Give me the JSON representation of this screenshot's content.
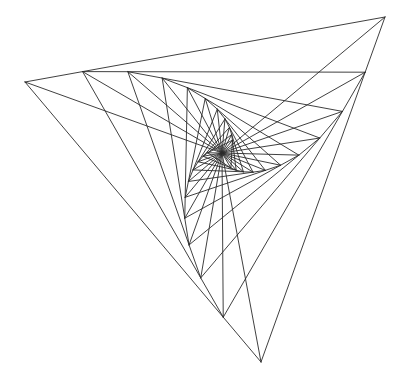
{
  "figure": {
    "width": 402,
    "height": 382,
    "background": "#ffffff",
    "stroke_color": "#2a2a2a",
    "outer_triangle": [
      [
        25,
        82
      ],
      [
        385,
        17
      ],
      [
        261,
        362
      ]
    ],
    "pursuit_ratio": 0.16,
    "iterations": 11,
    "center": [
      222,
      153
    ],
    "rays_to_center": true
  }
}
